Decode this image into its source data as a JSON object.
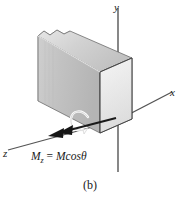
{
  "figure": {
    "caption": "(b)",
    "background_color": "#ffffff",
    "axes": [
      {
        "name": "y",
        "label": "y",
        "direction": "up"
      },
      {
        "name": "x",
        "label": "x",
        "direction": "right"
      },
      {
        "name": "z",
        "label": "z",
        "direction": "lower-left"
      }
    ],
    "moment": {
      "symbol": "M",
      "subscript": "z",
      "equals": "=",
      "expression_magnitude": "M",
      "expression_function": "cos",
      "expression_angle": "θ",
      "full_label": "M₂ = M cosθ",
      "vector_color": "#1a1a1a",
      "arrow_style": "double-headed",
      "direction": "along negative z"
    },
    "body": {
      "shape": "rectangular block",
      "description": "cut section of a shaft/bar with torn left end",
      "face_colors": {
        "top": "#d5d5d5",
        "left": "#c6c6c6",
        "front": "#e8e8e8",
        "right_cut": "#eeeeee"
      },
      "edge_color": "#4a4a4a"
    },
    "axis_color": "#555555",
    "curl_color": "#f2f2f2"
  }
}
